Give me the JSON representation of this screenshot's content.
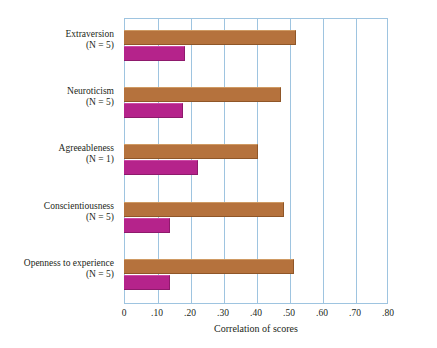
{
  "chart_data": {
    "type": "bar",
    "orientation": "horizontal",
    "title": "",
    "xlabel": "Correlation of scores",
    "ylabel": "",
    "xlim": [
      0,
      0.8
    ],
    "xticks": [
      0,
      0.1,
      0.2,
      0.3,
      0.4,
      0.5,
      0.6,
      0.7,
      0.8
    ],
    "xticklabels": [
      "0",
      ".10",
      ".20",
      ".30",
      ".40",
      ".50",
      ".60",
      ".70",
      ".80"
    ],
    "grid": true,
    "grid_axis": "x",
    "legend": "none",
    "categories": [
      "Extraversion",
      "Neuroticism",
      "Agreeableness",
      "Conscientiousness",
      "Openness to experience"
    ],
    "category_notes": [
      "(N = 5)",
      "(N = 5)",
      "(N = 1)",
      "(N = 5)",
      "(N = 5)"
    ],
    "series": [
      {
        "name": "series-brown",
        "color": "#b5723d",
        "values": [
          0.52,
          0.475,
          0.405,
          0.485,
          0.515
        ]
      },
      {
        "name": "series-magenta",
        "color": "#b5238b",
        "values": [
          0.185,
          0.18,
          0.225,
          0.14,
          0.14
        ]
      }
    ],
    "colors": {
      "brown": "#b5723d",
      "magenta": "#b5238b",
      "gridline": "#9ec4e0",
      "axis_text": "#231f20",
      "background": "#ffffff"
    }
  }
}
